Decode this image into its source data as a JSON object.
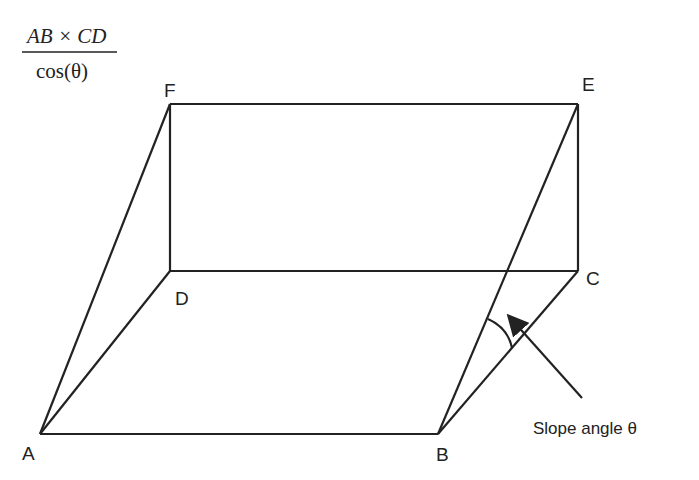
{
  "formula": {
    "numerator": "AB × CD",
    "denominator": "cos(θ)"
  },
  "vertices": {
    "A": {
      "label": "A",
      "x": 40,
      "y": 434
    },
    "B": {
      "label": "B",
      "x": 438,
      "y": 434
    },
    "C": {
      "label": "C",
      "x": 578,
      "y": 271
    },
    "D": {
      "label": "D",
      "x": 170,
      "y": 271
    },
    "E": {
      "label": "E",
      "x": 578,
      "y": 104
    },
    "F": {
      "label": "F",
      "x": 170,
      "y": 104
    }
  },
  "annotation": {
    "text": "Slope angle θ"
  },
  "colors": {
    "stroke": "#222222",
    "background": "#ffffff"
  }
}
